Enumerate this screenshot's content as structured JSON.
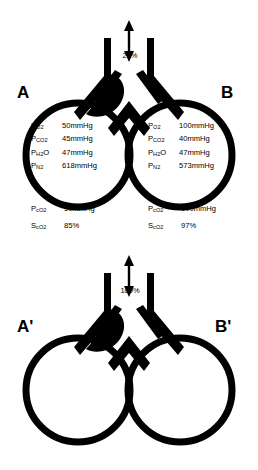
{
  "figure": {
    "type": "medical-diagram",
    "background_color": "#ffffff",
    "ink_color": "#000000"
  },
  "panels": [
    {
      "id": "top",
      "inspired_oxygen_label": "21%",
      "arrow": "double-headed-vertical",
      "units": [
        {
          "label": "A",
          "side": "left",
          "obstructed": true,
          "gases": [
            {
              "symbol": "P",
              "sub": "O",
              "sub2": "2",
              "value": "50mmHg"
            },
            {
              "symbol": "P",
              "sub": "CO",
              "sub2": "2",
              "value": "45mmHg"
            },
            {
              "symbol": "P",
              "sub": "H",
              "sub2": "2",
              "sub3": "O",
              "value": "47mmHg"
            },
            {
              "symbol": "P",
              "sub": "N",
              "sub2": "2",
              "value": "618mmHg"
            }
          ],
          "capillary": [
            {
              "symbol": "P",
              "sub": "cO",
              "sub2": "2",
              "value": "50mmHg"
            },
            {
              "symbol": "S",
              "sub": "cO",
              "sub2": "2",
              "value": "85%"
            }
          ]
        },
        {
          "label": "B",
          "side": "right",
          "obstructed": false,
          "gases": [
            {
              "symbol": "P",
              "sub": "O",
              "sub2": "2",
              "value": "100mmHg"
            },
            {
              "symbol": "P",
              "sub": "CO",
              "sub2": "2",
              "value": "40mmHg"
            },
            {
              "symbol": "P",
              "sub": "H",
              "sub2": "2",
              "sub3": "O",
              "value": "47mmHg"
            },
            {
              "symbol": "P",
              "sub": "N",
              "sub2": "2",
              "value": "573mmHg"
            }
          ],
          "capillary": [
            {
              "symbol": "P",
              "sub": "cO",
              "sub2": "2",
              "value": "100mmHg"
            },
            {
              "symbol": "S",
              "sub": "cO",
              "sub2": "2",
              "value": "97%"
            }
          ]
        }
      ]
    },
    {
      "id": "bottom",
      "inspired_oxygen_label": "100%",
      "arrow": "double-headed-vertical",
      "units": [
        {
          "label": "A'",
          "side": "left",
          "obstructed": true,
          "gases": [
            {
              "symbol": "P",
              "sub": "O",
              "sub2": "2",
              "value": "668mmHg"
            },
            {
              "symbol": "P",
              "sub": "CO",
              "sub2": "2",
              "value": "45mmHg"
            },
            {
              "symbol": "P",
              "sub": "H",
              "sub2": "2",
              "sub3": "O",
              "value": "47mmHg"
            }
          ],
          "capillary": [
            {
              "symbol": "P",
              "sub": "cO",
              "sub2": "2",
              "value": "668mmHg"
            },
            {
              "symbol": "S",
              "sub": "cO",
              "sub2": "2",
              "value": "100%"
            }
          ]
        },
        {
          "label": "B'",
          "side": "right",
          "obstructed": false,
          "gases": [
            {
              "symbol": "P",
              "sub": "O",
              "sub2": "2",
              "value": "673mmHg"
            },
            {
              "symbol": "P",
              "sub": "CO",
              "sub2": "2",
              "value": "40mmHg"
            },
            {
              "symbol": "P",
              "sub": "H",
              "sub2": "2",
              "sub3": "O",
              "value": "47mmHg"
            }
          ],
          "capillary": [
            {
              "symbol": "P",
              "sub": "cO",
              "sub2": "2",
              "value": "673mmHg"
            },
            {
              "symbol": "S",
              "sub": "cO",
              "sub2": "2",
              "value": "100%"
            }
          ]
        }
      ]
    }
  ]
}
